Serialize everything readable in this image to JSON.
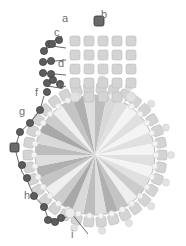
{
  "diagram": {
    "labels": [
      {
        "id": "a",
        "text": "a",
        "x": 62,
        "y": 22
      },
      {
        "id": "b",
        "text": "b",
        "x": 101,
        "y": 18
      },
      {
        "id": "c",
        "text": "c",
        "x": 54,
        "y": 36
      },
      {
        "id": "d",
        "text": "d",
        "x": 58,
        "y": 67
      },
      {
        "id": "e",
        "text": "e",
        "x": 58,
        "y": 89
      },
      {
        "id": "f",
        "text": "f",
        "x": 35,
        "y": 96
      },
      {
        "id": "g",
        "text": "g",
        "x": 19,
        "y": 115
      },
      {
        "id": "h",
        "text": "h",
        "x": 24,
        "y": 199
      },
      {
        "id": "i",
        "text": "i",
        "x": 71,
        "y": 238
      }
    ],
    "colors": {
      "cube_bead": "#d4d4d4",
      "cube_bead_stroke": "#b8b8b8",
      "dark_bead": "#5c5c5c",
      "dark_bead_stroke": "#3a3a3a",
      "round_bead_light": "#e2e2e2",
      "thread": "#444444",
      "stone_light": "#f2f2f2",
      "stone_mid": "#cfcfcf",
      "stone_dark": "#a9a9a9",
      "label": "#6f6f6f"
    },
    "stone": {
      "cx": 95,
      "cy": 155,
      "r": 60,
      "facets": 16
    },
    "bail": {
      "columns_x": [
        70,
        84,
        98,
        112,
        126
      ],
      "rows_y": [
        36,
        50,
        64,
        78,
        92
      ],
      "top_bead": {
        "x": 94,
        "y": 22
      }
    }
  }
}
